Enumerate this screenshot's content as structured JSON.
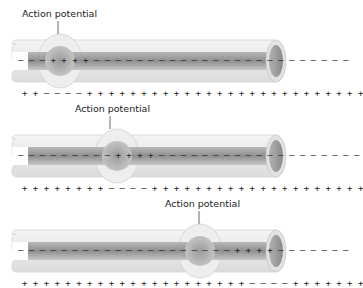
{
  "diagram": {
    "panels": [
      {
        "label": "Action potential",
        "inner_left_sign": "–",
        "inner_charges": "– – + + + + – – – – – – – – – – – – – – – – – – – – – – –",
        "outer_charges": "+ + – – – – + + + + + + + + + + + + + + + + + + + + + +",
        "ap_position_x": 60
      },
      {
        "label": "Action potential",
        "inner_left_sign": "–",
        "inner_charges": "– – – – – – – – + + + + – – – – – – – – – – – – – – – – –",
        "outer_charges": "+ + + + + + + + – – – – + + + + + + + + + + + + + + + + +",
        "ap_position_x": 120
      },
      {
        "label": "Action potential",
        "inner_left_sign": "–",
        "inner_charges": "– – – – – – – – – – – – – – – – – – – + + + + – – – – – – –",
        "outer_charges": "+ + + + + + + + + + + + + + + + + + + + – – – – + + + + + +",
        "ap_position_x": 200
      }
    ],
    "colors": {
      "membrane_light": "#ececec",
      "membrane_edge": "#cfcfcf",
      "core_dark": "#9a9a9a",
      "core_light": "#d6d6d6",
      "text": "#222222"
    }
  }
}
